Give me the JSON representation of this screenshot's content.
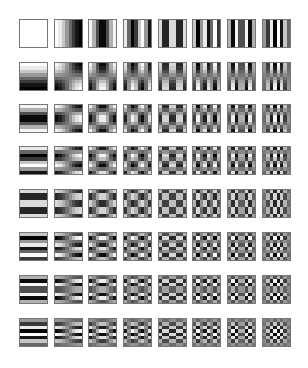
{
  "figure": {
    "rows": 8,
    "cols": 8,
    "block_size": 8,
    "tile_size_px": 27,
    "border_color": "#777777",
    "background": "#ffffff",
    "col_x": [
      19,
      54,
      88,
      123,
      158,
      192,
      227,
      262
    ],
    "row_y": [
      19,
      62,
      104,
      146,
      189,
      232,
      275,
      318
    ],
    "polarity": "positive=white, negative=black",
    "horizontal_frequency": "column index u",
    "vertical_frequency": "row index v"
  }
}
